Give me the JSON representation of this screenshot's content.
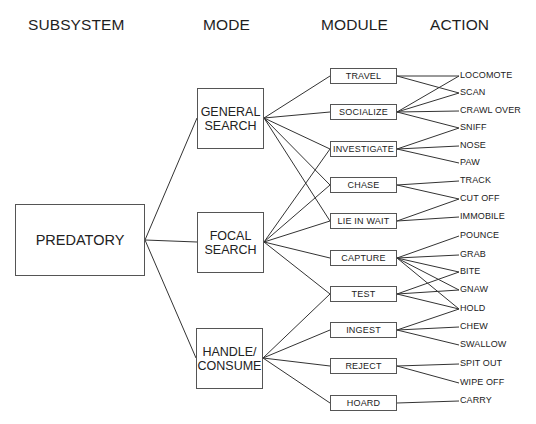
{
  "headers": {
    "subsystem": "SUBSYSTEM",
    "mode": "MODE",
    "module": "MODULE",
    "action": "ACTION"
  },
  "subsystem": {
    "id": "predatory",
    "label": "PREDATORY"
  },
  "modes": [
    {
      "id": "general_search",
      "line1": "GENERAL",
      "line2": "SEARCH"
    },
    {
      "id": "focal_search",
      "line1": "FOCAL",
      "line2": "SEARCH"
    },
    {
      "id": "handle_consume",
      "line1": "HANDLE/",
      "line2": "CONSUME"
    }
  ],
  "modules": [
    {
      "id": "travel",
      "label": "TRAVEL"
    },
    {
      "id": "socialize",
      "label": "SOCIALIZE"
    },
    {
      "id": "investigate",
      "label": "INVESTIGATE"
    },
    {
      "id": "chase",
      "label": "CHASE"
    },
    {
      "id": "lie_in_wait",
      "label": "LIE IN WAIT"
    },
    {
      "id": "capture",
      "label": "CAPTURE"
    },
    {
      "id": "test",
      "label": "TEST"
    },
    {
      "id": "ingest",
      "label": "INGEST"
    },
    {
      "id": "reject",
      "label": "REJECT"
    },
    {
      "id": "hoard",
      "label": "HOARD"
    }
  ],
  "actions": [
    {
      "id": "locomote",
      "label": "LOCOMOTE"
    },
    {
      "id": "scan",
      "label": "SCAN"
    },
    {
      "id": "crawl_over",
      "label": "CRAWL OVER"
    },
    {
      "id": "sniff",
      "label": "SNIFF"
    },
    {
      "id": "nose",
      "label": "NOSE"
    },
    {
      "id": "paw",
      "label": "PAW"
    },
    {
      "id": "track",
      "label": "TRACK"
    },
    {
      "id": "cut_off",
      "label": "CUT OFF"
    },
    {
      "id": "immobile",
      "label": "IMMOBILE"
    },
    {
      "id": "pounce",
      "label": "POUNCE"
    },
    {
      "id": "grab",
      "label": "GRAB"
    },
    {
      "id": "bite",
      "label": "BITE"
    },
    {
      "id": "gnaw",
      "label": "GNAW"
    },
    {
      "id": "hold",
      "label": "HOLD"
    },
    {
      "id": "chew",
      "label": "CHEW"
    },
    {
      "id": "swallow",
      "label": "SWALLOW"
    },
    {
      "id": "spit_out",
      "label": "SPIT OUT"
    },
    {
      "id": "wipe_off",
      "label": "WIPE OFF"
    },
    {
      "id": "carry",
      "label": "CARRY"
    }
  ],
  "edges": {
    "subsystem_to_mode": [
      [
        "predatory",
        "general_search"
      ],
      [
        "predatory",
        "focal_search"
      ],
      [
        "predatory",
        "handle_consume"
      ]
    ],
    "mode_to_module": [
      [
        "general_search",
        "travel"
      ],
      [
        "general_search",
        "socialize"
      ],
      [
        "general_search",
        "investigate"
      ],
      [
        "general_search",
        "chase"
      ],
      [
        "general_search",
        "lie_in_wait"
      ],
      [
        "focal_search",
        "investigate"
      ],
      [
        "focal_search",
        "chase"
      ],
      [
        "focal_search",
        "lie_in_wait"
      ],
      [
        "focal_search",
        "capture"
      ],
      [
        "focal_search",
        "test"
      ],
      [
        "handle_consume",
        "test"
      ],
      [
        "handle_consume",
        "ingest"
      ],
      [
        "handle_consume",
        "reject"
      ],
      [
        "handle_consume",
        "hoard"
      ]
    ],
    "module_to_action": [
      [
        "travel",
        "locomote"
      ],
      [
        "travel",
        "scan"
      ],
      [
        "socialize",
        "locomote"
      ],
      [
        "socialize",
        "scan"
      ],
      [
        "socialize",
        "crawl_over"
      ],
      [
        "socialize",
        "sniff"
      ],
      [
        "investigate",
        "sniff"
      ],
      [
        "investigate",
        "nose"
      ],
      [
        "investigate",
        "paw"
      ],
      [
        "chase",
        "track"
      ],
      [
        "chase",
        "cut_off"
      ],
      [
        "lie_in_wait",
        "cut_off"
      ],
      [
        "lie_in_wait",
        "immobile"
      ],
      [
        "capture",
        "pounce"
      ],
      [
        "capture",
        "grab"
      ],
      [
        "capture",
        "bite"
      ],
      [
        "capture",
        "gnaw"
      ],
      [
        "capture",
        "hold"
      ],
      [
        "test",
        "bite"
      ],
      [
        "test",
        "gnaw"
      ],
      [
        "test",
        "hold"
      ],
      [
        "ingest",
        "hold"
      ],
      [
        "ingest",
        "chew"
      ],
      [
        "ingest",
        "swallow"
      ],
      [
        "reject",
        "spit_out"
      ],
      [
        "reject",
        "wipe_off"
      ],
      [
        "hoard",
        "carry"
      ]
    ]
  },
  "colors": {
    "line": "#333333",
    "border": "#555555",
    "text": "#222222",
    "background": "#ffffff"
  }
}
